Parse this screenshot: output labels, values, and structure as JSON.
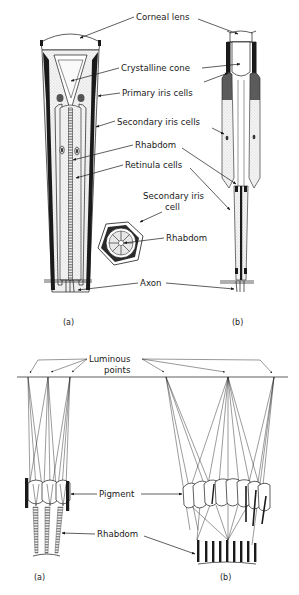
{
  "figure_top": {
    "labels": {
      "corneal_lens": "Corneal lens",
      "crystalline_cone": "Crystalline cone",
      "primary_iris_cells": "Primary iris cells",
      "secondary_iris_cells": "Secondary iris cells",
      "rhabdom": "Rhabdom",
      "retinula_cells": "Retinula cells",
      "secondary_iris_cell_l1": "Secondary iris",
      "secondary_iris_cell_l2": "cell",
      "rhabdom_cross": "Rhabdom",
      "axon": "Axon"
    },
    "captions": {
      "a": "(a)",
      "b": "(b)"
    }
  },
  "figure_bottom": {
    "labels": {
      "luminous_l1": "Luminous",
      "luminous_l2": "points",
      "pigment": "Pigment",
      "rhabdom": "Rhabdom"
    },
    "captions": {
      "a": "(a)",
      "b": "(b)"
    }
  }
}
